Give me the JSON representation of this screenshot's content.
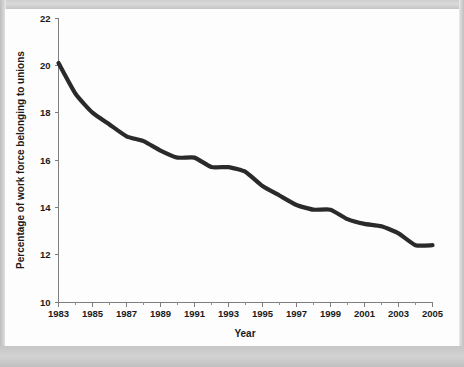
{
  "chart_data": {
    "type": "line",
    "title": "",
    "xlabel": "Year",
    "ylabel": "Percentage of work force belonging to unions",
    "xlim": [
      1983,
      2005
    ],
    "ylim": [
      10,
      22
    ],
    "grid": false,
    "legend": null,
    "x_tick_labels": [
      "1983",
      "1985",
      "1987",
      "1989",
      "1991",
      "1993",
      "1995",
      "1997",
      "1999",
      "2001",
      "2003",
      "2005"
    ],
    "x_tick_values": [
      1983,
      1985,
      1987,
      1989,
      1991,
      1993,
      1995,
      1997,
      1999,
      2001,
      2003,
      2005
    ],
    "x_minor_ticks": [
      1984,
      1986,
      1988,
      1990,
      1992,
      1994,
      1996,
      1998,
      2000,
      2002,
      2004
    ],
    "y_tick_labels": [
      "10",
      "12",
      "14",
      "16",
      "18",
      "20",
      "22"
    ],
    "y_tick_values": [
      10,
      12,
      14,
      16,
      18,
      20,
      22
    ],
    "x": [
      1983,
      1984,
      1985,
      1986,
      1987,
      1988,
      1989,
      1990,
      1991,
      1992,
      1993,
      1994,
      1995,
      1996,
      1997,
      1998,
      1999,
      2000,
      2001,
      2002,
      2003,
      2004,
      2005
    ],
    "values": [
      20.1,
      18.8,
      18.0,
      17.5,
      17.0,
      16.8,
      16.4,
      16.1,
      16.1,
      15.7,
      15.7,
      15.5,
      14.9,
      14.5,
      14.1,
      13.9,
      13.9,
      13.5,
      13.3,
      13.2,
      12.9,
      12.4,
      12.4
    ],
    "series": [
      {
        "name": "Percentage of work force belonging to unions",
        "color": "#2a2a2a",
        "values": [
          20.1,
          18.8,
          18.0,
          17.5,
          17.0,
          16.8,
          16.4,
          16.1,
          16.1,
          15.7,
          15.7,
          15.5,
          14.9,
          14.5,
          14.1,
          13.9,
          13.9,
          13.5,
          13.3,
          13.2,
          12.9,
          12.4,
          12.4
        ]
      }
    ],
    "colors": {
      "line": "#2a2a2a",
      "axis": "#7d7d7d",
      "text": "#1b1b1b",
      "plot_background": "#fdfdfd",
      "page_background": "#c9c9c9"
    }
  }
}
